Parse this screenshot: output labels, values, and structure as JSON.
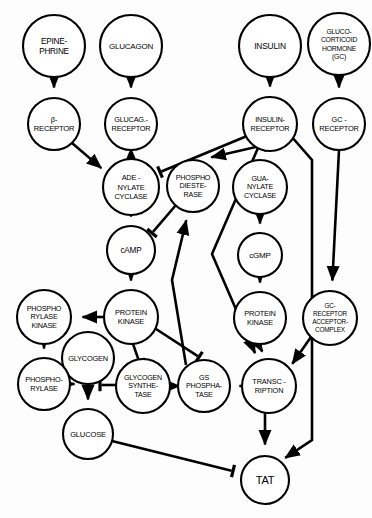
{
  "diagram": {
    "type": "signaling-pathway",
    "background_color": "#fdfdfd",
    "stroke_color": "#000000",
    "node_fill": "#ffffff",
    "nodes": [
      {
        "id": "epinephrine",
        "label": "EPINE-\nPHRINE",
        "lines": [
          "EPINE-",
          "PHRINE"
        ],
        "cx": 54,
        "cy": 46,
        "r": 31,
        "font": 8.2
      },
      {
        "id": "glucagon",
        "label": "GLUCAGON",
        "lines": [
          "GLUCAGON"
        ],
        "cx": 131,
        "cy": 46,
        "r": 31,
        "font": 8.0
      },
      {
        "id": "insulin",
        "label": "INSULIN",
        "lines": [
          "INSULIN"
        ],
        "cx": 270,
        "cy": 46,
        "r": 31,
        "font": 8.4
      },
      {
        "id": "gc-hormone",
        "label": "GLUCO-\nCORTICOID\nHORMONE\n(GC)",
        "lines": [
          "GLUCO-",
          "CORTICOID",
          "HORMONE",
          "(GC)"
        ],
        "cx": 339,
        "cy": 44,
        "r": 31,
        "font": 6.8
      },
      {
        "id": "beta-receptor",
        "label": "β-\nRECEPTOR",
        "lines": [
          "β-",
          "RECEPTOR"
        ],
        "cx": 54,
        "cy": 124,
        "r": 26,
        "font": 7.6
      },
      {
        "id": "glucagon-receptor",
        "label": "GLUCAG.-\nRECEPTOR",
        "lines": [
          "GLUCAG.-",
          "RECEPTOR"
        ],
        "cx": 131,
        "cy": 124,
        "r": 26,
        "font": 7.3
      },
      {
        "id": "insulin-receptor",
        "label": "INSULIN-\nRECEPTOR",
        "lines": [
          "INSULIN-",
          "RECEPTOR"
        ],
        "cx": 270,
        "cy": 124,
        "r": 27,
        "font": 7.3
      },
      {
        "id": "gc-receptor",
        "label": "GC -\nRECEPTOR",
        "lines": [
          "GC -",
          "RECEPTOR"
        ],
        "cx": 339,
        "cy": 124,
        "r": 26,
        "font": 7.4
      },
      {
        "id": "adenylate-cyclase",
        "label": "ADE -\nNYLATE\nCYCLASE",
        "lines": [
          "ADE -",
          "NYLATE",
          "CYCLASE"
        ],
        "cx": 131,
        "cy": 187,
        "r": 28,
        "font": 7.4
      },
      {
        "id": "phosphodiesterase",
        "label": "PHOSPHO\nDIESTE-\nRASE",
        "lines": [
          "PHOSPHO",
          "DIESTE-",
          "RASE"
        ],
        "cx": 193,
        "cy": 186,
        "r": 26,
        "font": 7.2
      },
      {
        "id": "guanylate-cyclase",
        "label": "GUA-\nNYLATE\nCYCLASE",
        "lines": [
          "GUA-",
          "NYLATE",
          "CYCLASE"
        ],
        "cx": 260,
        "cy": 187,
        "r": 27,
        "font": 7.2
      },
      {
        "id": "camp",
        "label": "cAMP",
        "lines": [
          "cAMP"
        ],
        "cx": 131,
        "cy": 250,
        "r": 24,
        "font": 8.2
      },
      {
        "id": "cgmp",
        "label": "cGMP",
        "lines": [
          "cGMP"
        ],
        "cx": 260,
        "cy": 255,
        "r": 22,
        "font": 8.0
      },
      {
        "id": "phosphorylase-kinase",
        "label": "PHOSPHO\nRYLASE\nKINASE",
        "lines": [
          "PHOSPHO",
          "RYLASE",
          "KINASE"
        ],
        "cx": 44,
        "cy": 317,
        "r": 27,
        "font": 7.2
      },
      {
        "id": "protein-kinase-a",
        "label": "PROTEIN\nKINASE",
        "lines": [
          "PROTEIN",
          "KINASE"
        ],
        "cx": 131,
        "cy": 317,
        "r": 27,
        "font": 7.5
      },
      {
        "id": "protein-kinase-g",
        "label": "PROTEIN\nKINASE",
        "lines": [
          "PROTEIN",
          "KINASE"
        ],
        "cx": 260,
        "cy": 318,
        "r": 26,
        "font": 7.4
      },
      {
        "id": "gc-receptor-acceptor-complex",
        "label": "GC-\nRECEPTOR\nACCEPTOR-\nCOMPLEX",
        "lines": [
          "GC-",
          "RECEPTOR",
          "ACCEPTOR-",
          "COMPLEX"
        ],
        "cx": 330,
        "cy": 318,
        "r": 27,
        "font": 6.4
      },
      {
        "id": "glycogen",
        "label": "GLYCOGEN",
        "lines": [
          "GLYCOGEN"
        ],
        "cx": 88,
        "cy": 358,
        "r": 26,
        "font": 7.4
      },
      {
        "id": "phosphorylase",
        "label": "PHOSPHO-\nRYLASE",
        "lines": [
          "PHOSPHO-",
          "RYLASE"
        ],
        "cx": 44,
        "cy": 384,
        "r": 26,
        "font": 7.3
      },
      {
        "id": "glycogen-synthetase",
        "label": "GLYCOGEN\nSYNTHE-\nTASE",
        "lines": [
          "GLYCOGEN",
          "SYNTHE-",
          "TASE"
        ],
        "cx": 143,
        "cy": 386,
        "r": 27,
        "font": 7.1
      },
      {
        "id": "gs-phosphatase",
        "label": "GS\nPHOSPHA-\nTASE",
        "lines": [
          "GS",
          "PHOSPHA-",
          "TASE"
        ],
        "cx": 204,
        "cy": 386,
        "r": 26,
        "font": 7.2
      },
      {
        "id": "transcription",
        "label": "TRANSC -\nRIPTION",
        "lines": [
          "TRANSC -",
          "RIPTION"
        ],
        "cx": 269,
        "cy": 386,
        "r": 27,
        "font": 7.4
      },
      {
        "id": "glucose",
        "label": "GLUCOSE",
        "lines": [
          "GLUCOSE"
        ],
        "cx": 88,
        "cy": 434,
        "r": 25,
        "font": 7.6
      },
      {
        "id": "tat",
        "label": "TAT",
        "lines": [
          "TAT"
        ],
        "cx": 265,
        "cy": 480,
        "r": 24,
        "font": 11.0
      }
    ],
    "edges": [
      {
        "from": "epinephrine",
        "to": "beta-receptor",
        "head": "arrow"
      },
      {
        "from": "glucagon",
        "to": "glucagon-receptor",
        "head": "arrow"
      },
      {
        "from": "insulin",
        "to": "insulin-receptor",
        "head": "arrow"
      },
      {
        "from": "gc-hormone",
        "to": "gc-receptor",
        "head": "arrow"
      },
      {
        "from": "beta-receptor",
        "to": "adenylate-cyclase",
        "head": "arrow"
      },
      {
        "from": "glucagon-receptor",
        "to": "adenylate-cyclase",
        "head": "arrow"
      },
      {
        "from": "insulin-receptor",
        "to": "adenylate-cyclase",
        "head": "bar"
      },
      {
        "from": "insulin-receptor",
        "to": "phosphodiesterase",
        "head": "arrow"
      },
      {
        "from": "insulin-receptor",
        "to": "guanylate-cyclase",
        "head": "arrow"
      },
      {
        "from": "insulin-receptor",
        "to": "transcription",
        "head": "arrow"
      },
      {
        "from": "insulin-receptor",
        "to": "tat",
        "head": "arrow"
      },
      {
        "from": "adenylate-cyclase",
        "to": "camp",
        "head": "arrow"
      },
      {
        "from": "guanylate-cyclase",
        "to": "cgmp",
        "head": "arrow"
      },
      {
        "from": "phosphodiesterase",
        "to": "camp",
        "head": "bar"
      },
      {
        "from": "camp",
        "to": "protein-kinase-a",
        "head": "arrow"
      },
      {
        "from": "cgmp",
        "to": "protein-kinase-g",
        "head": "arrow"
      },
      {
        "from": "gc-receptor",
        "to": "gc-receptor-acceptor-complex",
        "head": "arrow"
      },
      {
        "from": "gc-receptor-acceptor-complex",
        "to": "transcription",
        "head": "arrow"
      },
      {
        "from": "protein-kinase-a",
        "to": "phosphorylase-kinase",
        "head": "arrow"
      },
      {
        "from": "protein-kinase-a",
        "to": "glycogen-synthetase",
        "head": "bar"
      },
      {
        "from": "protein-kinase-a",
        "to": "gs-phosphatase",
        "head": "bar"
      },
      {
        "from": "phosphorylase-kinase",
        "to": "phosphorylase",
        "head": "arrow"
      },
      {
        "from": "phosphorylase",
        "to": "glycogen-breakdown",
        "head": "arrow"
      },
      {
        "from": "glycogen",
        "to": "glucose",
        "head": "arrow"
      },
      {
        "from": "glycogen-synthetase",
        "to": "glycogen-breakdown",
        "head": "bar"
      },
      {
        "from": "gs-phosphatase",
        "to": "glycogen-synthetase",
        "head": "arrow"
      },
      {
        "from": "gs-phosphatase",
        "to": "phosphodiesterase",
        "head": "arrow"
      },
      {
        "from": "transcription",
        "to": "gs-phosphatase",
        "head": "arrow"
      },
      {
        "from": "protein-kinase-g",
        "to": "transcription",
        "head": "arrow"
      },
      {
        "from": "transcription",
        "to": "tat",
        "head": "arrow"
      },
      {
        "from": "glucose",
        "to": "tat",
        "head": "bar"
      }
    ]
  }
}
